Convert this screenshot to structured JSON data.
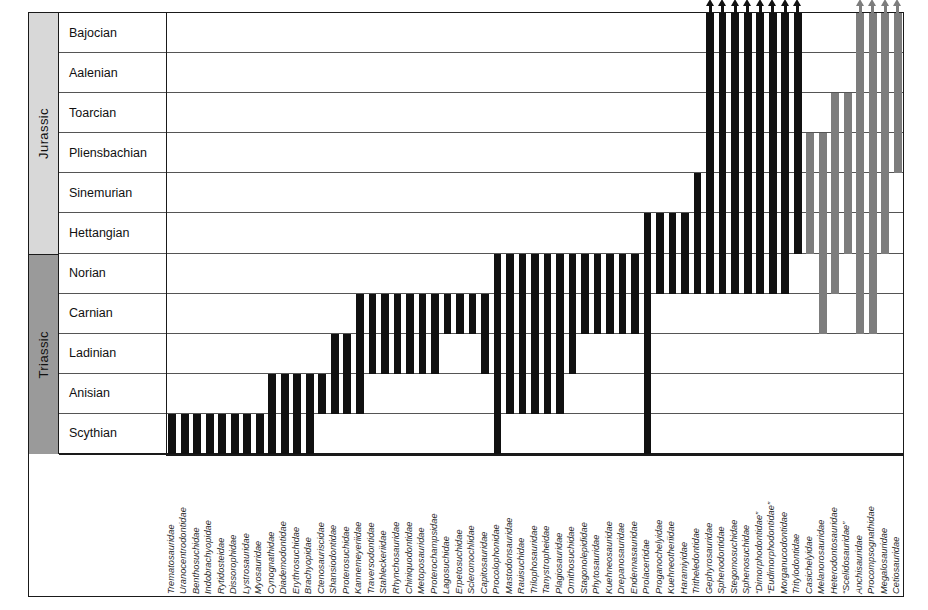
{
  "chart_data": {
    "type": "range-chart",
    "xlabel": "",
    "ylabel": "",
    "grid": true,
    "legend": "none",
    "colors": {
      "black_bar": "#111111",
      "gray_bar": "#7d7d7d",
      "period_jurassic_fill": "#d8d8d8",
      "period_triassic_fill": "#9a9a9a",
      "frame": "#1a1a1a",
      "rowline": "#555555",
      "background": "#ffffff"
    },
    "periods": [
      {
        "name": "Jurassic",
        "stages": [
          "Bajocian",
          "Aalenian",
          "Toarcian",
          "Pliensbachian",
          "Sinemurian",
          "Hettangian"
        ]
      },
      {
        "name": "Triassic",
        "stages": [
          "Norian",
          "Carnian",
          "Ladinian",
          "Anisian",
          "Scythian"
        ]
      }
    ],
    "stages_top_to_bottom": [
      "Bajocian",
      "Aalenian",
      "Toarcian",
      "Pliensbachian",
      "Sinemurian",
      "Hettangian",
      "Norian",
      "Carnian",
      "Ladinian",
      "Anisian",
      "Scythian"
    ],
    "note_on_ranges": "top index 0 = Bajocian (youngest, top row); bottom index 10 = Scythian (oldest, bottom row). A range spans rows [top..bottom] inclusive.",
    "taxa": [
      {
        "name": "Trematosauridae",
        "top": 10,
        "bottom": 10,
        "color": "black",
        "arrow": false
      },
      {
        "name": "Uranocentrodontidae",
        "top": 10,
        "bottom": 10,
        "color": "black",
        "arrow": false
      },
      {
        "name": "Benthosuchidae",
        "top": 10,
        "bottom": 10,
        "color": "black",
        "arrow": false
      },
      {
        "name": "Indobrachyopidae",
        "top": 10,
        "bottom": 10,
        "color": "black",
        "arrow": false
      },
      {
        "name": "Rytidosteidae",
        "top": 10,
        "bottom": 10,
        "color": "black",
        "arrow": false
      },
      {
        "name": "Dissorophidae",
        "top": 10,
        "bottom": 10,
        "color": "black",
        "arrow": false
      },
      {
        "name": "Lystrosauridae",
        "top": 10,
        "bottom": 10,
        "color": "black",
        "arrow": false
      },
      {
        "name": "Myosauridae",
        "top": 10,
        "bottom": 10,
        "color": "black",
        "arrow": false
      },
      {
        "name": "Cynognathidae",
        "top": 9,
        "bottom": 10,
        "color": "black",
        "arrow": false
      },
      {
        "name": "Diademodontidae",
        "top": 9,
        "bottom": 10,
        "color": "black",
        "arrow": false
      },
      {
        "name": "Erythrosuchidae",
        "top": 9,
        "bottom": 10,
        "color": "black",
        "arrow": false
      },
      {
        "name": "Brachyopidae",
        "top": 9,
        "bottom": 10,
        "color": "black",
        "arrow": false
      },
      {
        "name": "Ctenosauriscidae",
        "top": 9,
        "bottom": 9,
        "color": "black",
        "arrow": false
      },
      {
        "name": "Shansiodontidae",
        "top": 8,
        "bottom": 9,
        "color": "black",
        "arrow": false
      },
      {
        "name": "Proterosuchidae",
        "top": 8,
        "bottom": 9,
        "color": "black",
        "arrow": false
      },
      {
        "name": "Kannemeyeriidae",
        "top": 7,
        "bottom": 9,
        "color": "black",
        "arrow": false
      },
      {
        "name": "Traversodontidae",
        "top": 7,
        "bottom": 8,
        "color": "black",
        "arrow": false
      },
      {
        "name": "Stahleckeriidae",
        "top": 7,
        "bottom": 8,
        "color": "black",
        "arrow": false
      },
      {
        "name": "Rhynchosauridae",
        "top": 7,
        "bottom": 8,
        "color": "black",
        "arrow": false
      },
      {
        "name": "Chiniquodontidae",
        "top": 7,
        "bottom": 8,
        "color": "black",
        "arrow": false
      },
      {
        "name": "Metoposauridae",
        "top": 7,
        "bottom": 8,
        "color": "black",
        "arrow": false
      },
      {
        "name": "Proterochampsidae",
        "top": 7,
        "bottom": 8,
        "color": "black",
        "arrow": false
      },
      {
        "name": "Lagosuchidae",
        "top": 7,
        "bottom": 7,
        "color": "black",
        "arrow": false
      },
      {
        "name": "Erpetosuchidae",
        "top": 7,
        "bottom": 7,
        "color": "black",
        "arrow": false
      },
      {
        "name": "Scleromochlidae",
        "top": 7,
        "bottom": 7,
        "color": "black",
        "arrow": false
      },
      {
        "name": "Capitosauridae",
        "top": 7,
        "bottom": 8,
        "color": "black",
        "arrow": false
      },
      {
        "name": "Procolophonidae",
        "top": 6,
        "bottom": 10,
        "color": "black",
        "arrow": false
      },
      {
        "name": "Mastodonsauridae",
        "top": 6,
        "bottom": 9,
        "color": "black",
        "arrow": false
      },
      {
        "name": "Rauisuchidae",
        "top": 6,
        "bottom": 9,
        "color": "black",
        "arrow": false
      },
      {
        "name": "Trilophosauridae",
        "top": 6,
        "bottom": 9,
        "color": "black",
        "arrow": false
      },
      {
        "name": "Tanystropheidae",
        "top": 6,
        "bottom": 9,
        "color": "black",
        "arrow": false
      },
      {
        "name": "Plagiosauridae",
        "top": 6,
        "bottom": 9,
        "color": "black",
        "arrow": false
      },
      {
        "name": "Ornithosuchidae",
        "top": 6,
        "bottom": 8,
        "color": "black",
        "arrow": false
      },
      {
        "name": "Stagonolepididae",
        "top": 6,
        "bottom": 7,
        "color": "black",
        "arrow": false
      },
      {
        "name": "Phytosauridae",
        "top": 6,
        "bottom": 7,
        "color": "black",
        "arrow": false
      },
      {
        "name": "Kuehneosauridae",
        "top": 6,
        "bottom": 7,
        "color": "black",
        "arrow": false
      },
      {
        "name": "Drepanosauridae",
        "top": 6,
        "bottom": 7,
        "color": "black",
        "arrow": false
      },
      {
        "name": "Endennasauridae",
        "top": 6,
        "bottom": 7,
        "color": "black",
        "arrow": false
      },
      {
        "name": "Prolacertidae",
        "top": 5,
        "bottom": 10,
        "color": "black",
        "arrow": false
      },
      {
        "name": "Proganochelyidae",
        "top": 5,
        "bottom": 6,
        "color": "black",
        "arrow": false
      },
      {
        "name": "Kuehneotheriidae",
        "top": 5,
        "bottom": 6,
        "color": "black",
        "arrow": false
      },
      {
        "name": "Haramiyidae",
        "top": 5,
        "bottom": 6,
        "color": "black",
        "arrow": false
      },
      {
        "name": "Tritheledontidae",
        "top": 4,
        "bottom": 6,
        "color": "black",
        "arrow": false
      },
      {
        "name": "Gephyrosauridae",
        "top": 0,
        "bottom": 6,
        "color": "black",
        "arrow": true
      },
      {
        "name": "Sphenodontidae",
        "top": 0,
        "bottom": 6,
        "color": "black",
        "arrow": true
      },
      {
        "name": "Stegomosuchidae",
        "top": 0,
        "bottom": 6,
        "color": "black",
        "arrow": true
      },
      {
        "name": "Sphenosuchidae",
        "top": 0,
        "bottom": 6,
        "color": "black",
        "arrow": true
      },
      {
        "name": "“Dimorphodontidae”",
        "top": 0,
        "bottom": 6,
        "color": "black",
        "arrow": true
      },
      {
        "name": "“Eudimorphodontidae”",
        "top": 0,
        "bottom": 6,
        "color": "black",
        "arrow": true
      },
      {
        "name": "Morganucodontidae",
        "top": 0,
        "bottom": 6,
        "color": "black",
        "arrow": true
      },
      {
        "name": "Tritylodontidae",
        "top": 0,
        "bottom": 5,
        "color": "black",
        "arrow": true
      },
      {
        "name": "Casichelyidae",
        "top": 3,
        "bottom": 5,
        "color": "gray",
        "arrow": false
      },
      {
        "name": "Melanorosauridae",
        "top": 3,
        "bottom": 7,
        "color": "gray",
        "arrow": false
      },
      {
        "name": "Heterodontosauridae",
        "top": 2,
        "bottom": 6,
        "color": "gray",
        "arrow": false
      },
      {
        "name": "“Scelidosauridae”",
        "top": 2,
        "bottom": 5,
        "color": "gray",
        "arrow": false
      },
      {
        "name": "Anchisauridae",
        "top": 0,
        "bottom": 7,
        "color": "gray",
        "arrow": true
      },
      {
        "name": "Procompsognathidae",
        "top": 0,
        "bottom": 7,
        "color": "gray",
        "arrow": true
      },
      {
        "name": "Megalosauridae",
        "top": 0,
        "bottom": 5,
        "color": "gray",
        "arrow": true
      },
      {
        "name": "Cetiosauridae",
        "top": 0,
        "bottom": 3,
        "color": "gray",
        "arrow": true
      }
    ]
  }
}
